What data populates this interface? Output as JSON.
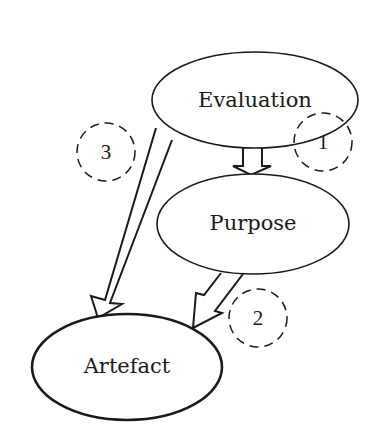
{
  "diagram": {
    "nodes": [
      {
        "id": "evaluation",
        "label": "Evaluation"
      },
      {
        "id": "purpose",
        "label": "Purpose"
      },
      {
        "id": "artefact",
        "label": "Artefact"
      }
    ],
    "edges": [
      {
        "id": "1",
        "from": "evaluation",
        "to": "purpose",
        "label": "1"
      },
      {
        "id": "2",
        "from": "purpose",
        "to": "artefact",
        "label": "2"
      },
      {
        "id": "3",
        "from": "evaluation",
        "to": "artefact",
        "label": "3"
      }
    ],
    "colors": {
      "stroke": "#1a1a1a",
      "background": "#ffffff"
    }
  }
}
